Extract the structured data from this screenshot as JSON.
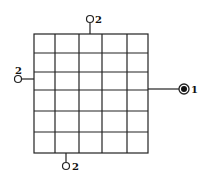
{
  "diagram": {
    "grid": {
      "columns": 5,
      "rows": 6,
      "col_lines": [
        34,
        55,
        79,
        102,
        127,
        148
      ],
      "row_lines": [
        34,
        53,
        72,
        90,
        111,
        132,
        153
      ],
      "stroke": "#222222"
    },
    "terminals": [
      {
        "id": "top",
        "type": "open-circle",
        "label": "2"
      },
      {
        "id": "left",
        "type": "open-circle",
        "label": "2"
      },
      {
        "id": "bottom",
        "type": "open-circle",
        "label": "2"
      },
      {
        "id": "right",
        "type": "filled-circle-ring",
        "label": "1"
      }
    ]
  }
}
